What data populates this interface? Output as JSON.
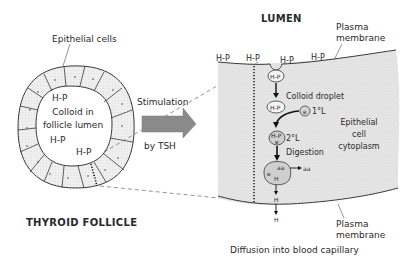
{
  "diagram": {
    "left": {
      "title": "THYROID FOLLICLE",
      "epithelial_label": "Epithelial cells",
      "colloid_label_line1": "Colloid in",
      "colloid_label_line2": "follicle lumen",
      "hp_labels": [
        "H-P",
        "H-P",
        "H-P"
      ]
    },
    "arrow": {
      "label_top": "Stimulation",
      "label_bottom": "by TSH",
      "color": "#8a8a8a"
    },
    "right": {
      "lumen_label": "LUMEN",
      "plasma_membrane_top": [
        "Plasma",
        "membrane"
      ],
      "plasma_membrane_bottom": [
        "Plasma",
        "membrane"
      ],
      "surface_hp": [
        "H-P",
        "H-P",
        "H-P",
        "H-P"
      ],
      "vesicle_hp": "H-P",
      "colloid_droplet": "Colloid droplet",
      "droplet_hp": "H-P",
      "primary_lysosome_symbol": "e",
      "primary_lysosome": "1°L",
      "secondary_lysosome_hp": "H-P",
      "secondary_lysosome_e": "e",
      "secondary_lysosome": "2°L",
      "digestion": "Digestion",
      "digest_aa": "aa",
      "digest_e": "e",
      "digest_h": "H",
      "aa_out": "aa",
      "h_mid": "H",
      "h_out": "H",
      "cytoplasm_label": [
        "Epithelial",
        "cell",
        "cytoplasm"
      ],
      "footer": "Diffusion into blood capillary",
      "cytoplasm_color": "#e4e4e4"
    }
  }
}
